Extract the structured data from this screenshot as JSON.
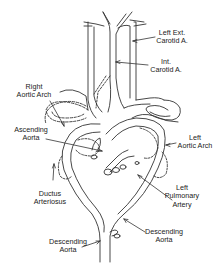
{
  "diagram": {
    "colors": {
      "line": "#333333",
      "background": "#ffffff",
      "text": "#222222"
    },
    "labels": [
      {
        "id": "left-ext-carotid",
        "lines": [
          "Left Ext.",
          "Carotid A."
        ]
      },
      {
        "id": "int-carotid",
        "lines": [
          "Int.",
          "Carotid A."
        ]
      },
      {
        "id": "right-aortic-arch",
        "lines": [
          "Right",
          "Aortic Arch"
        ]
      },
      {
        "id": "ascending-aorta",
        "lines": [
          "Ascending",
          "Aorta"
        ]
      },
      {
        "id": "left-aortic-arch",
        "lines": [
          "Left",
          "Aortic Arch"
        ]
      },
      {
        "id": "ductus-arteriosus",
        "lines": [
          "Ductus",
          "Arteriosus"
        ]
      },
      {
        "id": "left-pulmonary-artery",
        "lines": [
          "Left",
          "Pulmonary",
          "Artery"
        ]
      },
      {
        "id": "descending-aorta-left",
        "lines": [
          "Descending",
          "Aorta"
        ]
      },
      {
        "id": "descending-aorta-right",
        "lines": [
          "Descending",
          "Aorta"
        ]
      }
    ]
  }
}
